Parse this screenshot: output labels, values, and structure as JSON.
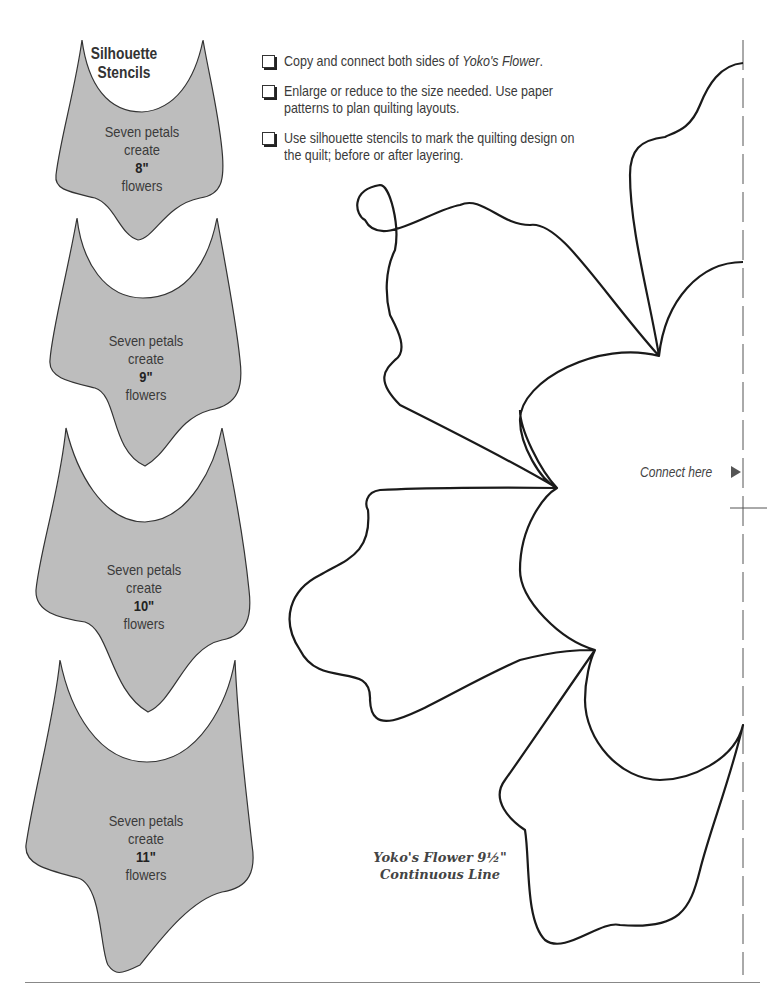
{
  "stencils": {
    "title": "Silhouette Stencils",
    "title_line1": "Silhouette",
    "title_line2": "Stencils",
    "fill_color": "#bdbdbd",
    "items": [
      {
        "line1": "Seven petals",
        "line2": "create",
        "size": "8\"",
        "line4": "flowers"
      },
      {
        "line1": "Seven petals",
        "line2": "create",
        "size": "9\"",
        "line4": "flowers"
      },
      {
        "line1": "Seven petals",
        "line2": "create",
        "size": "10\"",
        "line4": "flowers"
      },
      {
        "line1": "Seven petals",
        "line2": "create",
        "size": "11\"",
        "line4": "flowers"
      }
    ]
  },
  "checklist": {
    "items": [
      {
        "text": "Copy and connect both sides of ",
        "emphasis": "Yoko's Flower",
        "suffix": "."
      },
      {
        "text": "Enlarge or reduce to the size needed. Use paper patterns to plan quilting layouts."
      },
      {
        "text": "Use silhouette stencils to mark the quilting design on the quilt; before or after layering."
      }
    ]
  },
  "pattern": {
    "connect_label": "Connect here",
    "caption_line1": "Yoko's Flower 9½\"",
    "caption_line2": "Continuous Line",
    "line_color": "#1a1a1a"
  }
}
